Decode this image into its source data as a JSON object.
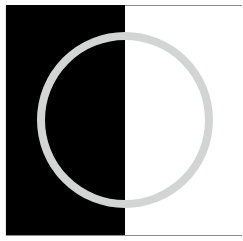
{
  "figure": {
    "colors": {
      "left_panel": "#000000",
      "right_panel": "#ffffff",
      "ring": "#d3d5d4",
      "edge": "#8c8c8c",
      "left_edge": "#e6e6e6"
    },
    "ring": {
      "cx": 125,
      "cy": 120,
      "r": 84,
      "stroke_width": 8
    }
  }
}
